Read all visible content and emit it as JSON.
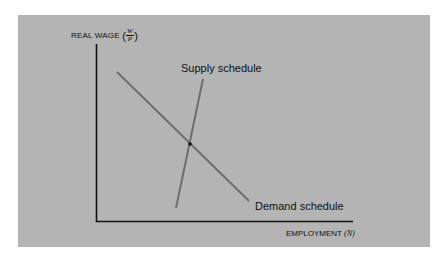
{
  "diagram": {
    "background_color": "#b4b4b4",
    "y_axis": {
      "label": "REAL WAGE",
      "fraction_numerator": "W",
      "fraction_denominator": "P",
      "open_paren": "(",
      "close_paren": ")"
    },
    "x_axis": {
      "label": "EMPLOYMENT",
      "variable": "(N)"
    },
    "curves": [
      {
        "name": "Supply schedule",
        "slope": "upward, steep",
        "color": "#6e6e6e"
      },
      {
        "name": "Demand schedule",
        "slope": "downward",
        "color": "#6e6e6e"
      }
    ],
    "equilibrium_point": {
      "marker": "dot",
      "color": "#111111"
    }
  }
}
